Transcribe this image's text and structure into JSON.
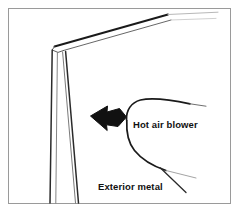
{
  "figure": {
    "name": "door-edge-hot-air-blower-diagram",
    "type": "technical-line-drawing",
    "width": 239,
    "height": 212,
    "background_color": "#ffffff",
    "border": {
      "color": "#9a9a9a",
      "width_px": 1,
      "inset_px": 8
    },
    "line_color": "#1a1a1a",
    "labels": {
      "blower": "Hot air blower",
      "exterior": "Exterior metal"
    },
    "parts": {
      "panel_label": "door panel edge",
      "arrow_label": "hot air flow arrow",
      "blower_outline_label": "hot air blower nozzle outline"
    }
  }
}
